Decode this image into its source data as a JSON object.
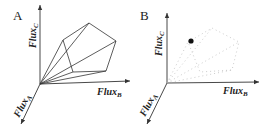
{
  "panels": [
    {
      "label": "A",
      "axes": {
        "x": {
          "name": "Flux",
          "sub": "B"
        },
        "y": {
          "name": "Flux",
          "sub": "C"
        },
        "z": {
          "name": "Flux",
          "sub": "A"
        }
      },
      "description": "Flux cone: polygon of extreme pathways with rays from origin"
    },
    {
      "label": "B",
      "axes": {
        "x": {
          "name": "Flux",
          "sub": "B"
        },
        "y": {
          "name": "Flux",
          "sub": "C"
        },
        "z": {
          "name": "Flux",
          "sub": "A"
        }
      },
      "description": "Faint dotted cone with a single solution point marked"
    }
  ]
}
